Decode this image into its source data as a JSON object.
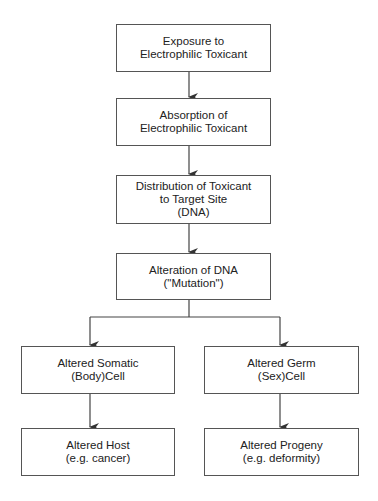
{
  "diagram": {
    "type": "flowchart",
    "nodes": [
      {
        "id": "exposure",
        "lines": [
          "Exposure to",
          "Electrophilic Toxicant"
        ]
      },
      {
        "id": "absorption",
        "lines": [
          "Absorption of",
          "Electrophilic Toxicant"
        ]
      },
      {
        "id": "distribution",
        "lines": [
          "Distribution of Toxicant",
          "to Target Site",
          "(DNA)"
        ]
      },
      {
        "id": "alteration",
        "lines": [
          "Alteration of DNA",
          "(\"Mutation\")"
        ]
      },
      {
        "id": "somatic",
        "lines": [
          "Altered Somatic",
          "(Body)Cell"
        ]
      },
      {
        "id": "germ",
        "lines": [
          "Altered Germ",
          "(Sex)Cell"
        ]
      },
      {
        "id": "host",
        "lines": [
          "Altered Host",
          "(e.g. cancer)"
        ]
      },
      {
        "id": "progeny",
        "lines": [
          "Altered Progeny",
          "(e.g. deformity)"
        ]
      }
    ],
    "edges": [
      [
        "exposure",
        "absorption"
      ],
      [
        "absorption",
        "distribution"
      ],
      [
        "distribution",
        "alteration"
      ],
      [
        "alteration",
        "somatic"
      ],
      [
        "alteration",
        "germ"
      ],
      [
        "somatic",
        "host"
      ],
      [
        "germ",
        "progeny"
      ]
    ],
    "colors": {
      "line": "#444444",
      "border": "#555555",
      "text": "#222222",
      "background": "#ffffff"
    }
  }
}
